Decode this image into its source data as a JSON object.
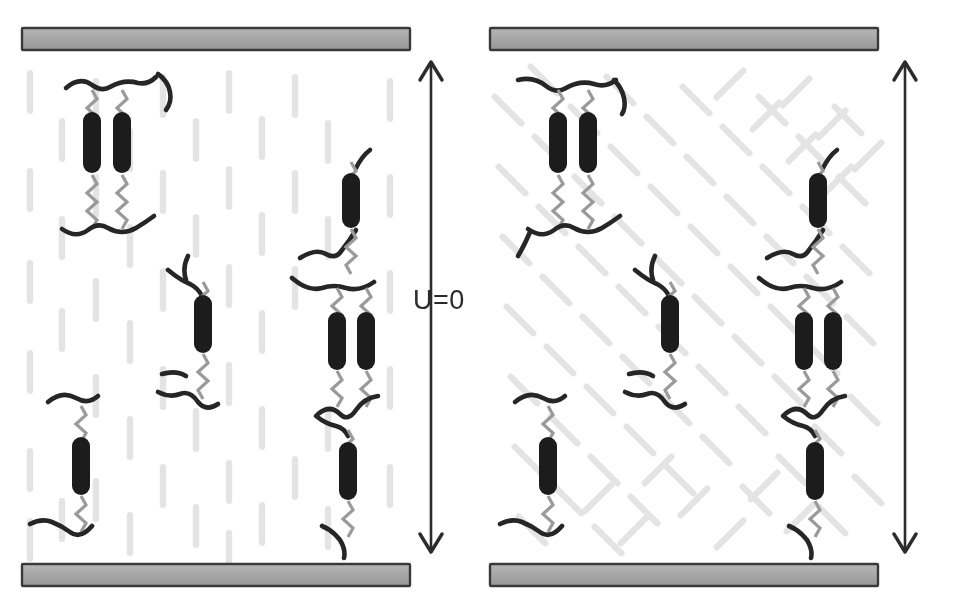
{
  "figure": {
    "background_color": "#ffffff"
  },
  "colors": {
    "electrode_fill": "#a9a9a9",
    "electrode_stroke": "#3a3a3a",
    "mesogen_dark": "#1c1c1c",
    "backbone_dark": "#262626",
    "spacer_gray": "#9a9a9a",
    "background_rod": "#e2e2e2",
    "arrow": "#2b2b2b",
    "label_text": "#2b2b2b"
  },
  "panels": [
    {
      "id": "left",
      "state_label": "U=0",
      "state_description": "no applied voltage",
      "director_orientation": "vertical",
      "background_rod_angle_deg": 0,
      "top_electrode": {
        "name": "top-electrode",
        "x": 22,
        "y": 28,
        "width": 388,
        "height": 22
      },
      "bottom_electrode": {
        "name": "bottom-electrode",
        "x": 22,
        "y": 564,
        "width": 388,
        "height": 22
      },
      "arrow": {
        "name": "cell-gap-arrow",
        "x": 431,
        "y": 60,
        "length": 494,
        "double_headed": true
      },
      "mesogens": [
        {
          "cx": 92,
          "cy": 142,
          "angle": 0
        },
        {
          "cx": 122,
          "cy": 142,
          "angle": 0
        },
        {
          "cx": 203,
          "cy": 323,
          "angle": 0
        },
        {
          "cx": 351,
          "cy": 199,
          "angle": 0
        },
        {
          "cx": 337,
          "cy": 341,
          "angle": 0
        },
        {
          "cx": 366,
          "cy": 341,
          "angle": 0
        },
        {
          "cx": 81,
          "cy": 466,
          "angle": 0
        },
        {
          "cx": 348,
          "cy": 472,
          "angle": 0
        }
      ]
    },
    {
      "id": "right",
      "state_label": "U=V",
      "state_description": "voltage applied",
      "director_orientation": "tilted-herringbone",
      "background_rod_angle_deg": 45,
      "top_electrode": {
        "name": "top-electrode",
        "x": 12,
        "y": 28,
        "width": 388,
        "height": 22
      },
      "bottom_electrode": {
        "name": "bottom-electrode",
        "x": 12,
        "y": 564,
        "width": 388,
        "height": 22
      },
      "arrow": {
        "name": "cell-gap-arrow",
        "x": 421,
        "y": 60,
        "length": 494,
        "double_headed": true
      },
      "mesogens": [
        {
          "cx": 80,
          "cy": 142,
          "angle": 0
        },
        {
          "cx": 110,
          "cy": 142,
          "angle": 0
        },
        {
          "cx": 192,
          "cy": 323,
          "angle": 0
        },
        {
          "cx": 340,
          "cy": 199,
          "angle": 0
        },
        {
          "cx": 326,
          "cy": 341,
          "angle": 0
        },
        {
          "cx": 355,
          "cy": 341,
          "angle": 0
        },
        {
          "cx": 70,
          "cy": 466,
          "angle": 0
        },
        {
          "cx": 337,
          "cy": 472,
          "angle": 0
        }
      ]
    }
  ],
  "legend_semantics": {
    "electrode": "conductive plate",
    "dark_rod": "liquid crystal mesogen unit",
    "zigzag": "flexible spacer",
    "thick_curve": "polymer backbone chain",
    "faint_rod": "bulk liquid crystal director field"
  }
}
